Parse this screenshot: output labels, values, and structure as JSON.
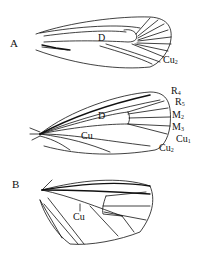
{
  "figure": {
    "panels": [
      {
        "id": "A",
        "label": "A",
        "wings": [
          {
            "name": "forewing-upper",
            "labels": [
              {
                "text": "D",
                "sub": ""
              },
              {
                "text": "Cu",
                "sub": "2"
              }
            ]
          },
          {
            "name": "forewing-lower",
            "labels": [
              {
                "text": "R",
                "sub": "4"
              },
              {
                "text": "R",
                "sub": "5"
              },
              {
                "text": "D",
                "sub": ""
              },
              {
                "text": "M",
                "sub": "2"
              },
              {
                "text": "M",
                "sub": "3"
              },
              {
                "text": "Cu",
                "sub": ""
              },
              {
                "text": "Cu",
                "sub": "1"
              },
              {
                "text": "Cu",
                "sub": "2"
              }
            ]
          }
        ]
      },
      {
        "id": "B",
        "label": "B",
        "wings": [
          {
            "name": "hindwing",
            "labels": [
              {
                "text": "Cu",
                "sub": ""
              }
            ]
          }
        ]
      }
    ],
    "colors": {
      "line": "#111111",
      "background": "#ffffff"
    }
  }
}
